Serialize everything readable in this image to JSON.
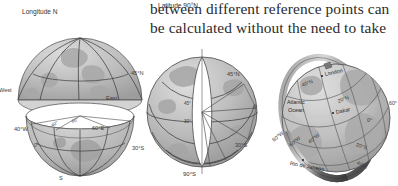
{
  "document": {
    "type": "textbook-figure-page",
    "paragraph_lines": [
      "between different reference points can",
      "be calculated without the need to take"
    ]
  },
  "figures": {
    "left": {
      "name": "longitude-hemisphere-diagram",
      "caption_top": "Longitude N",
      "labels": {
        "west": "West",
        "east": "East",
        "lat45n": "45°N",
        "lon40w": "40°W",
        "lon60e": "60°E",
        "lat30s": "30°S",
        "south": "S",
        "zero_a": "0°",
        "zero_b": "0°",
        "zero_c": "0°",
        "angle_a": "40°",
        "angle_b": "60°"
      }
    },
    "middle": {
      "name": "latitude-globe-diagram",
      "caption_top": "Latitude 90°N",
      "caption_bottom": "90°S",
      "labels": {
        "lat45n": "45°N",
        "angle45": "45°",
        "angle30": "30°",
        "zero": "0°",
        "lat30s": "30°S"
      }
    },
    "right": {
      "name": "atlantic-globe-grid-diagram",
      "places": [
        {
          "name": "London",
          "dot": true
        },
        {
          "name": "Dakar",
          "dot": true
        },
        {
          "name": "Rio de Janeiro",
          "dot": true
        },
        {
          "name": "Atlantic",
          "dot": false
        },
        {
          "name": "Ocean",
          "dot": false
        }
      ],
      "grid_labels": [
        "40°N",
        "20°N",
        "0°",
        "20°S",
        "40°S",
        "80°W",
        "60°W",
        "40°W",
        "60°"
      ]
    }
  },
  "colors": {
    "globe_fill": "#b9b9b9",
    "globe_light": "#d2d2d2",
    "globe_dark": "#9a9a9a",
    "line": "#3f3f3f",
    "text": "#333333",
    "paper": "#ffffff",
    "ring_dark": "#6f6f6f"
  }
}
